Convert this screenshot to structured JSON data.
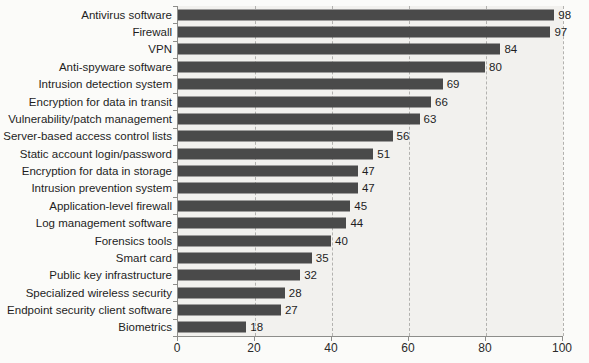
{
  "chart_data": {
    "type": "bar",
    "orientation": "horizontal",
    "title": "",
    "xlabel": "",
    "ylabel": "",
    "categories": [
      "Antivirus software",
      "Firewall",
      "VPN",
      "Anti-spyware software",
      "Intrusion detection system",
      "Encryption for data in transit",
      "Vulnerability/patch management",
      "Server-based access control lists",
      "Static account login/password",
      "Encryption for data in storage",
      "Intrusion prevention system",
      "Application-level firewall",
      "Log management software",
      "Forensics tools",
      "Smart card",
      "Public key infrastructure",
      "Specialized wireless security",
      "Endpoint security client software",
      "Biometrics"
    ],
    "values": [
      98,
      97,
      84,
      80,
      69,
      66,
      63,
      56,
      51,
      47,
      47,
      45,
      44,
      40,
      35,
      32,
      28,
      27,
      18
    ],
    "value_labels_shown": true,
    "xlim": [
      0,
      100
    ],
    "x_ticks": [
      0,
      20,
      40,
      60,
      80,
      100
    ],
    "grid": "vertical dashed lines at 20, 40, 60, 80, 100",
    "legend": "none",
    "colors": {
      "bar": "#4a4a4a",
      "plot_background": "#f2f1ee",
      "page_background": "#fbfbf9",
      "axis": "#8d8d8a",
      "gridline": "#b3b2af",
      "text": "#1e1e1e"
    }
  }
}
